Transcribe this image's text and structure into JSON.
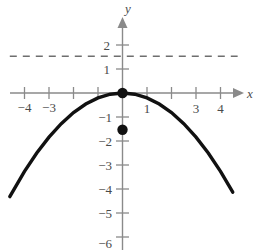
{
  "figure": {
    "axis_labels": {
      "x": "x",
      "y": "y"
    },
    "x_tick_labels": [
      {
        "value": -4,
        "text": "−4"
      },
      {
        "value": -3,
        "text": "−3"
      },
      {
        "value": -2,
        "text": ""
      },
      {
        "value": -1,
        "text": ""
      },
      {
        "value": 1,
        "text": "1"
      },
      {
        "value": 2,
        "text": ""
      },
      {
        "value": 3,
        "text": "3"
      },
      {
        "value": 4,
        "text": "4"
      }
    ],
    "y_tick_labels": [
      {
        "value": 2,
        "text": "2"
      },
      {
        "value": 1,
        "text": "1"
      },
      {
        "value": -1,
        "text": "−1"
      },
      {
        "value": -2,
        "text": "−2"
      },
      {
        "value": -3,
        "text": "−3"
      },
      {
        "value": -4,
        "text": "−4"
      },
      {
        "value": -5,
        "text": "−5"
      },
      {
        "value": -6,
        "text": "−6"
      }
    ],
    "colors": {
      "axis": "#8a8a8a",
      "curve": "#111111",
      "dashed": "#6e6e6e",
      "tick_text": "#4a4a4a",
      "background": "#ffffff"
    }
  },
  "chart_data": {
    "type": "line",
    "title": "",
    "xlabel": "x",
    "ylabel": "y",
    "xlim": [
      -4.6,
      4.8
    ],
    "ylim": [
      -6.4,
      2.6
    ],
    "grid": false,
    "legend": "none",
    "series": [
      {
        "name": "parabola",
        "equation": "y = -0.2x^2",
        "style": "solid",
        "color": "#111111",
        "x": [
          -4.6,
          -4.0,
          -3.5,
          -3.0,
          -2.5,
          -2.0,
          -1.5,
          -1.0,
          -0.5,
          0.0,
          0.5,
          1.0,
          1.5,
          2.0,
          2.5,
          3.0,
          3.5,
          4.0,
          4.5
        ],
        "values": [
          -4.23,
          -3.2,
          -2.45,
          -1.8,
          -1.25,
          -0.8,
          -0.45,
          -0.2,
          -0.05,
          0.0,
          -0.05,
          -0.2,
          -0.45,
          -0.8,
          -1.25,
          -1.8,
          -2.45,
          -3.2,
          -4.05
        ]
      },
      {
        "name": "horizontal-asymptote",
        "equation": "y = 1.5",
        "style": "dashed",
        "color": "#6e6e6e",
        "x": [
          -4.6,
          4.7
        ],
        "values": [
          1.5,
          1.5
        ]
      }
    ],
    "points": [
      {
        "name": "vertex",
        "x": 0,
        "y": 0,
        "marker": "filled-circle",
        "label": ""
      },
      {
        "name": "y-offset-point",
        "x": 0,
        "y": -1.5,
        "marker": "filled-circle",
        "label": ""
      }
    ],
    "annotations": []
  }
}
